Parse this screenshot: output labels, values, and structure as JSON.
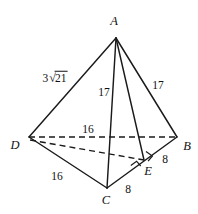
{
  "figure": {
    "type": "geometry-diagram",
    "shape": "tetrahedron",
    "background_color": "#ffffff",
    "line_color": "#1a1a1a",
    "width": 198,
    "height": 214,
    "vertices": [
      {
        "id": "A",
        "label": "A",
        "x": 116,
        "y": 38,
        "label_x": 114,
        "label_y": 21
      },
      {
        "id": "B",
        "label": "B",
        "x": 177,
        "y": 137,
        "label_x": 187,
        "label_y": 146
      },
      {
        "id": "C",
        "label": "C",
        "x": 107,
        "y": 188,
        "label_x": 106,
        "label_y": 200
      },
      {
        "id": "D",
        "label": "D",
        "x": 29,
        "y": 137,
        "label_x": 15,
        "label_y": 145
      },
      {
        "id": "E",
        "label": "E",
        "x": 144,
        "y": 160,
        "label_x": 148,
        "label_y": 171
      }
    ],
    "edges": [
      {
        "from": "A",
        "to": "D",
        "style": "solid",
        "hidden": false
      },
      {
        "from": "A",
        "to": "B",
        "style": "solid",
        "hidden": false
      },
      {
        "from": "A",
        "to": "C",
        "style": "solid",
        "hidden": false
      },
      {
        "from": "A",
        "to": "E",
        "style": "solid",
        "hidden": false
      },
      {
        "from": "D",
        "to": "C",
        "style": "solid",
        "hidden": false
      },
      {
        "from": "C",
        "to": "B",
        "style": "solid",
        "hidden": false
      },
      {
        "from": "D",
        "to": "B",
        "style": "dashed",
        "hidden": true
      },
      {
        "from": "D",
        "to": "E",
        "style": "dashed",
        "hidden": true
      }
    ],
    "right_angles": [
      {
        "at": "E",
        "between": [
          "A",
          "B"
        ],
        "note": "AE perpendicular to CB"
      },
      {
        "at": "E",
        "between": [
          "D",
          "B"
        ],
        "note": "DE perpendicular to CB"
      }
    ],
    "measures": [
      {
        "id": "AD",
        "text": "3√21",
        "has_radical": true,
        "coefficient": "3",
        "radicand": "21",
        "x": 55,
        "y": 78
      },
      {
        "id": "AC",
        "text": "17",
        "has_radical": false,
        "x": 104,
        "y": 93
      },
      {
        "id": "AB",
        "text": "17",
        "has_radical": false,
        "x": 158,
        "y": 86
      },
      {
        "id": "DB",
        "text": "16",
        "has_radical": false,
        "x": 88,
        "y": 130
      },
      {
        "id": "DC",
        "text": "16",
        "has_radical": false,
        "x": 57,
        "y": 177
      },
      {
        "id": "CE",
        "text": "8",
        "has_radical": false,
        "x": 128,
        "y": 190
      },
      {
        "id": "EB",
        "text": "8",
        "has_radical": false,
        "x": 165,
        "y": 160
      }
    ]
  }
}
